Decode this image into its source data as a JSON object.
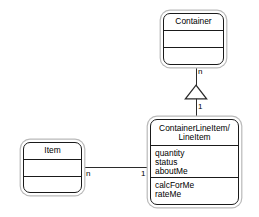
{
  "diagram": {
    "type": "uml-class-diagram",
    "background_color": "#ffffff",
    "line_color": "#2b2b2b",
    "box_border_color": "#1a1a1a",
    "box_shadow_color": "#b9b9b9"
  },
  "classes": {
    "container": {
      "name": "Container",
      "attributes": [],
      "operations": []
    },
    "item": {
      "name": "Item",
      "attributes": [],
      "operations": []
    },
    "container_line_item": {
      "name_line1": "ContainerLineItem/",
      "name_line2": "LineItem",
      "attributes": [
        "quantity",
        "status",
        "aboutMe"
      ],
      "operations": [
        "calcForMe",
        "rateMe"
      ]
    }
  },
  "relationships": {
    "generalization": {
      "kind": "generalization",
      "from": "ContainerLineItem/LineItem",
      "to": "Container",
      "multiplicity_near_container": "n",
      "multiplicity_near_lineitem": "1"
    },
    "association": {
      "kind": "association",
      "from": "Item",
      "to": "ContainerLineItem/LineItem",
      "multiplicity_near_item": "n",
      "multiplicity_near_lineitem": "1"
    }
  }
}
